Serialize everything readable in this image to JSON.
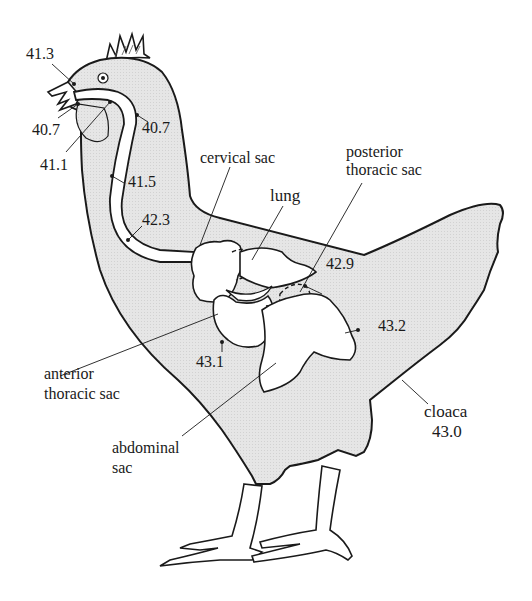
{
  "diagram": {
    "colors": {
      "body_fill": "#e3e3e3",
      "outline": "#1a1a1a",
      "sac_fill": "#ffffff",
      "background": "#ffffff"
    },
    "temperatures": {
      "beak_top": "41.3",
      "beak_lower": "40.7",
      "throat": "41.1",
      "neck_upper": "40.7",
      "neck_mid": "41.5",
      "neck_lower": "42.3",
      "posterior_thoracic": "42.9",
      "anterior_thoracic": "43.1",
      "abdominal": "43.2",
      "cloaca": "43.0"
    },
    "labels": {
      "cervical_sac": "cervical sac",
      "lung": "lung",
      "posterior_thoracic_1": "posterior",
      "posterior_thoracic_2": "thoracic sac",
      "anterior_thoracic_1": "anterior",
      "anterior_thoracic_2": "thoracic sac",
      "abdominal_1": "abdominal",
      "abdominal_2": "sac",
      "cloaca": "cloaca"
    }
  }
}
